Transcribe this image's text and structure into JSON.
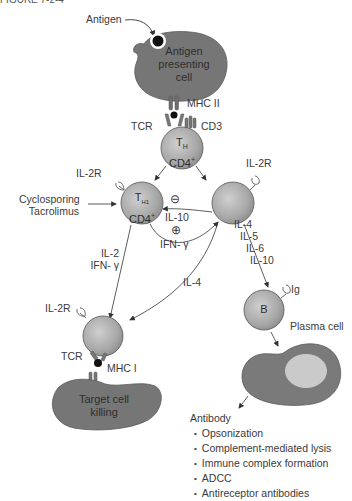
{
  "figure": {
    "top_cutoff_text": "FIGURE 7-2-4",
    "antigen_label": "Antigen",
    "apc": {
      "line1": "Antigen",
      "line2": "presenting",
      "line3": "cell"
    },
    "mhc2_label": "MHC II",
    "tcr_label_top": "TCR",
    "cd3_label": "CD3",
    "th_cell": {
      "line1": "T",
      "sub": "H",
      "line2": "CD4",
      "sup": "+"
    },
    "th1_cell": {
      "line1": "T",
      "sub": "H1",
      "line2": "CD4",
      "sup": "+"
    },
    "il2r_left": "IL-2R",
    "il2r_right": "IL-2R",
    "drugs": {
      "line1": "Cyclosporing",
      "line2": "Tacrolimus"
    },
    "inhibit_symbol": "⊖",
    "il10_label": "IL-10",
    "enhance_symbol": "⊕",
    "ifn_center": "IFN- γ",
    "th1_outputs": {
      "line1": "IL-2",
      "line2": "IFN- γ"
    },
    "th2_outputs": [
      "IL-4",
      "IL-5",
      "IL-6",
      "IL-10"
    ],
    "il4_to_ctl": "IL-4",
    "ig_label": "Ig",
    "b_cell": "B",
    "plasma_label": "Plasma cell",
    "ctl_il2r": "IL-2R",
    "tcr_label_bottom": "TCR",
    "mhc1_label": "MHC I",
    "target": {
      "line1": "Target cell",
      "line2": "killing"
    },
    "antibody": {
      "heading": "Antibody",
      "items": [
        "Opsonization",
        "Complement-mediated lysis",
        "Immune complex formation",
        "ADCC",
        "Antireceptor antibodies"
      ]
    }
  },
  "colors": {
    "cell_dark": "#6f6f6f",
    "cell_sphere": "#a9a9a9",
    "nucleus": "#c9c9c9",
    "antigen": "#111111",
    "line": "#333333"
  }
}
